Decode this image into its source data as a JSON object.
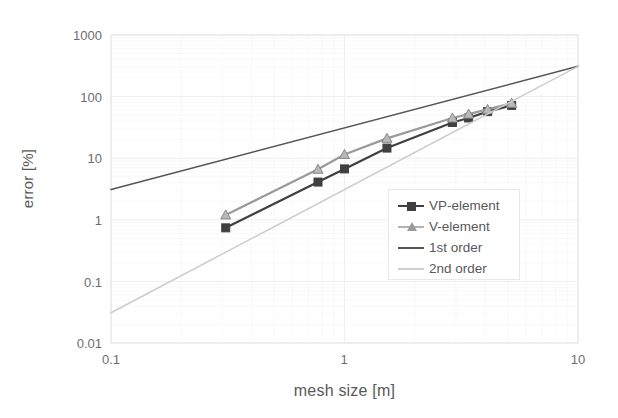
{
  "chart_data": {
    "type": "line",
    "title": "",
    "xlabel": "mesh size [m]",
    "ylabel": "error [%]",
    "xscale": "log",
    "yscale": "log",
    "xlim": [
      0.1,
      10
    ],
    "ylim": [
      0.01,
      1000
    ],
    "grid": true,
    "legend_position": "center-right",
    "xticks": [
      "0.1",
      "1",
      "10"
    ],
    "xtick_values": [
      0.1,
      1,
      10
    ],
    "yticks": [
      "0.01",
      "0.1",
      "1",
      "10",
      "100",
      "1000"
    ],
    "ytick_values": [
      0.01,
      0.1,
      1,
      10,
      100,
      1000
    ],
    "series": [
      {
        "name": "VP-element",
        "marker": "square",
        "color": "#404040",
        "x": [
          0.31,
          0.77,
          1.0,
          1.52,
          2.9,
          3.4,
          4.1,
          5.2
        ],
        "y": [
          0.74,
          4.1,
          6.7,
          14.6,
          38,
          45,
          57,
          72
        ]
      },
      {
        "name": "V-element",
        "marker": "triangle",
        "color": "#9a9a9a",
        "x": [
          0.31,
          0.77,
          1.0,
          1.52,
          2.9,
          3.4,
          4.1,
          5.2
        ],
        "y": [
          1.2,
          6.6,
          11.5,
          21,
          45,
          52,
          62,
          78
        ]
      },
      {
        "name": "1st order",
        "marker": "none",
        "color": "#555555",
        "x": [
          0.1,
          10
        ],
        "y": [
          3.1,
          310
        ]
      },
      {
        "name": "2nd order",
        "marker": "none",
        "color": "#cccccc",
        "x": [
          0.1,
          10
        ],
        "y": [
          0.031,
          310
        ]
      }
    ]
  },
  "legend": {
    "entries": [
      {
        "label": "VP-element",
        "key": "square-marker"
      },
      {
        "label": "V-element",
        "key": "triangle-marker"
      },
      {
        "label": "1st order",
        "key": "line-dark"
      },
      {
        "label": "2nd order",
        "key": "line-light"
      }
    ]
  },
  "colors": {
    "vp_element": "#404040",
    "v_element": "#9a9a9a",
    "first_order": "#555555",
    "second_order": "#cccccc",
    "grid": "#f0eef0",
    "axis_text": "#6d6e71",
    "label_text": "#58595b",
    "background": "#ffffff"
  }
}
